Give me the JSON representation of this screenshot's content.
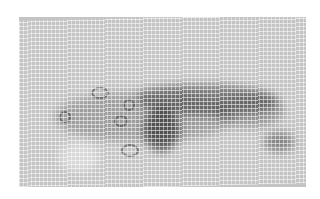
{
  "image": {
    "description": "Grayscale photograph of gauze mesh fabric with a dark elongated stain",
    "palette": {
      "background": "#ffffff",
      "fabric": "#c4c4c4",
      "stain": "#3a3a3a"
    }
  }
}
